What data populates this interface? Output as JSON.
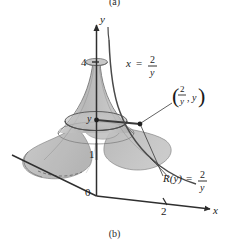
{
  "figure": {
    "caption_top": "(a)",
    "caption_bottom": "(b)",
    "axes": {
      "y_label": "y",
      "x_label": "x",
      "origin_label": "0",
      "tick_y_4": "4",
      "tick_y_1": "1",
      "tick_x_2": "2"
    },
    "annotations": {
      "curve_label_lhs": "x",
      "curve_label_eq": "=",
      "curve_label_num": "2",
      "curve_label_den": "y",
      "point_label_num": "2",
      "point_label_den": "y",
      "point_label_second": "y",
      "point_label_comma": ",",
      "radius_label_lhs": "R(y)",
      "radius_label_eq": "=",
      "radius_label_num": "2",
      "radius_label_den": "y",
      "axis_point_label": "y"
    },
    "colors": {
      "surface_fill": "#b9b9b9",
      "surface_fill_light": "#cfcfcf",
      "surface_fill_dark": "#a8a8a8",
      "outline": "#6e6e6e",
      "axis": "#3a3a3a",
      "text": "#1a1a1a"
    }
  }
}
